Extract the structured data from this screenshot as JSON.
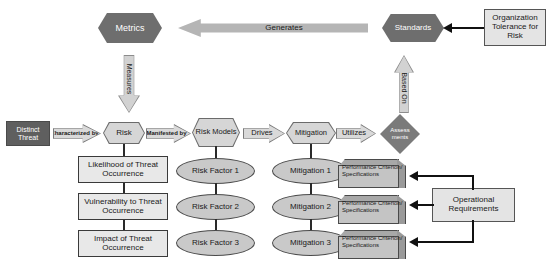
{
  "diagram": {
    "colors": {
      "dark_hex": "#6e6e6e",
      "light_hex": "#d6d6d6",
      "arrow_gray": "#bdbdbd",
      "box_fill": "#e8e8e8",
      "ellipse_fill": "#c9c9c9",
      "diamond_fill": "#7a7a7a",
      "box3d_fill": "#c4c4c4",
      "line": "#111111"
    },
    "nodes": {
      "metrics": "Metrics",
      "standards": "Standards",
      "org_tolerance": "Organization Tolerance for Risk",
      "distinct_threat": "Distinct Threat",
      "risk": "Risk",
      "risk_models": "Risk Models",
      "mitigation": "Mitigation",
      "assessments": "Assess ments",
      "operational_requirements": "Operational Requirements"
    },
    "arrows": {
      "generates": "Generates",
      "measures": "Measures",
      "based_on": "Based On",
      "characterized_by": "Characterized by",
      "manifested_by": "Manifested by",
      "drives": "Drives",
      "utilizes": "Utilizes"
    },
    "risk_detail_boxes": [
      "Likelihood of Threat Occurrence",
      "Vulnerability to Threat Occurrence",
      "Impact of Threat Occurrence"
    ],
    "risk_factors": [
      "Risk Factor 1",
      "Risk Factor 2",
      "Risk Factor 3"
    ],
    "mitigations": [
      "Mitigation 1",
      "Mitigation 2",
      "Mitigation 3"
    ],
    "performance_boxes": [
      "Performance Criterion/ Specifications",
      "Performance Criterion/ Specifications",
      "Performance Criterion/ Specifications"
    ]
  }
}
